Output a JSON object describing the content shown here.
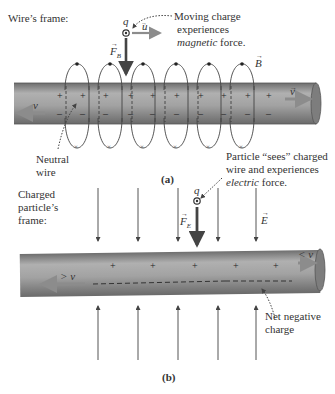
{
  "panel_a": {
    "frame_label": "Wire’s frame:",
    "charge_label": "q",
    "velocity_label": "u",
    "force_label": "F",
    "force_subscript": "B",
    "field_label": "B",
    "wire_velocity_label": "v",
    "electron_velocity_label": "v",
    "annotation_charge": [
      "Moving charge",
      "experiences"
    ],
    "annotation_charge_italic": "magnetic",
    "annotation_charge_tail": " force.",
    "annotation_wire": [
      "Neutral",
      "wire"
    ],
    "caption": "(a)",
    "plus_sign": "+",
    "minus_sign": "–",
    "loop_count": 6
  },
  "panel_b": {
    "frame_label": [
      "Charged",
      "particle’s",
      "frame:"
    ],
    "charge_label": "q",
    "force_label": "F",
    "force_subscript": "E",
    "field_label": "E",
    "electron_velocity_label": "> v",
    "ion_velocity_label": "< v",
    "annotation_particle": [
      "Particle “sees” charged",
      "wire and experiences"
    ],
    "annotation_particle_italic": "electric",
    "annotation_particle_tail": " force.",
    "annotation_charge": [
      "Net negative",
      "charge"
    ],
    "caption": "(b)",
    "plus_sign": "+",
    "plus_count": 5
  },
  "colors": {
    "wire_fill": "#9a9a9a",
    "wire_edge": "#555555",
    "arrow_gray": "#8c8c8c",
    "ink": "#333333"
  }
}
